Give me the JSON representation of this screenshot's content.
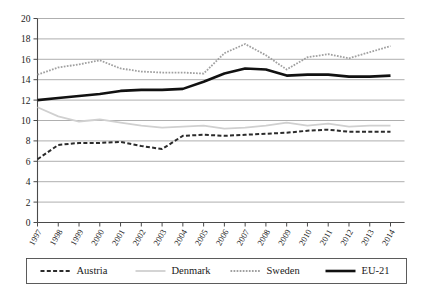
{
  "chart_data": {
    "type": "line",
    "title": "",
    "subtitle": "",
    "xlabel": "",
    "ylabel": "",
    "x": [
      "1997",
      "1998",
      "1999",
      "2000",
      "2001",
      "2002",
      "2003",
      "2004",
      "2005",
      "2006",
      "2007",
      "2008",
      "2009",
      "2010",
      "2011",
      "2012",
      "2013",
      "2014"
    ],
    "xlim": [
      1997,
      2014
    ],
    "ylim": [
      0,
      20
    ],
    "ytick_labels": [
      "0",
      "2",
      "4",
      "6",
      "8",
      "10",
      "12",
      "14",
      "16",
      "18",
      "20"
    ],
    "ytick_values": [
      0,
      2,
      4,
      6,
      8,
      10,
      12,
      14,
      16,
      18,
      20
    ],
    "grid": "horizontal",
    "legend_position": "bottom",
    "series": [
      {
        "name": "Austria",
        "style": "dashed",
        "color": "#2b2b2b",
        "width": 2.0,
        "values": [
          6.2,
          7.6,
          7.8,
          7.8,
          7.9,
          7.5,
          7.2,
          8.5,
          8.6,
          8.5,
          8.6,
          8.7,
          8.8,
          9.0,
          9.1,
          8.9,
          8.9,
          8.9
        ]
      },
      {
        "name": "Denmark",
        "style": "solid",
        "color": "#d0d0d0",
        "width": 1.8,
        "values": [
          11.3,
          10.4,
          9.9,
          10.1,
          9.8,
          9.5,
          9.3,
          9.4,
          9.5,
          9.2,
          9.3,
          9.5,
          9.8,
          9.5,
          9.7,
          9.4,
          9.5,
          9.5
        ]
      },
      {
        "name": "Sweden",
        "style": "dotted",
        "color": "#a0a0a0",
        "width": 1.8,
        "values": [
          14.5,
          15.2,
          15.5,
          15.9,
          15.1,
          14.8,
          14.7,
          14.7,
          14.6,
          16.6,
          17.5,
          16.4,
          15.0,
          16.2,
          16.5,
          16.1,
          16.7,
          17.3
        ]
      },
      {
        "name": "EU-21",
        "style": "solid",
        "color": "#111111",
        "width": 2.6,
        "values": [
          12.0,
          12.2,
          12.4,
          12.6,
          12.9,
          13.0,
          13.0,
          13.1,
          13.8,
          14.6,
          15.1,
          15.0,
          14.4,
          14.5,
          14.5,
          14.3,
          14.3,
          14.4
        ]
      }
    ]
  },
  "legend": {
    "items": [
      {
        "label": "Austria"
      },
      {
        "label": "Denmark"
      },
      {
        "label": "Sweden"
      },
      {
        "label": "EU-21"
      }
    ]
  }
}
